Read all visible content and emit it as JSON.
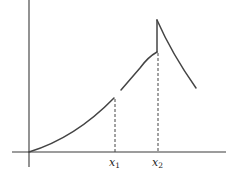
{
  "diagram": {
    "axes": {
      "x_label": "",
      "y_label": ""
    },
    "markers": [
      {
        "name": "x1",
        "base": "x",
        "subscript": "1"
      },
      {
        "name": "x2",
        "base": "x",
        "subscript": "2"
      }
    ],
    "segments": [
      {
        "name": "increasing-convex-segment",
        "from": "origin",
        "to": "x1",
        "note": "ends with open gap at x1"
      },
      {
        "name": "increasing-concave-segment",
        "from": "x1",
        "to": "x2",
        "note": "starts higher than left limit at x1"
      },
      {
        "name": "decreasing-segment",
        "from": "x2",
        "to": "end",
        "note": "starts after vertical jump up at x2"
      }
    ],
    "colors": {
      "line": "#444444",
      "background": "#ffffff"
    }
  }
}
